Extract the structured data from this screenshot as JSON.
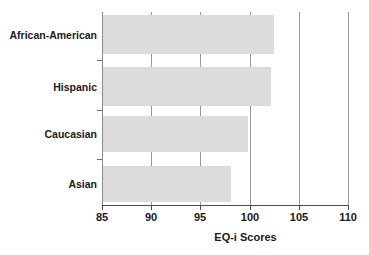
{
  "chart_data": {
    "type": "bar",
    "orientation": "horizontal",
    "title": "",
    "subtitle": "",
    "categories": [
      "African-American",
      "Hispanic",
      "Caucasian",
      "Asian"
    ],
    "values": [
      102.5,
      102.2,
      99.8,
      98.1
    ],
    "xlabel": "EQ-i Scores",
    "ylabel": "",
    "xlim": [
      85,
      110
    ],
    "xticks": [
      85,
      90,
      95,
      100,
      105,
      110
    ],
    "xtick_labels": [
      "85",
      "90",
      "95",
      "100",
      "105",
      "110"
    ],
    "grid": true,
    "legend": "none",
    "bar_color": "#dcdcdc",
    "axis_color": "#4d4d4d",
    "gridline_color": "#9a9a9a",
    "text_color": "#1a1a1a",
    "background": "#ffffff"
  },
  "axis": {
    "x_title": "EQ-i Scores"
  },
  "ticks": {
    "t0": "85",
    "t1": "90",
    "t2": "95",
    "t3": "100",
    "t4": "105",
    "t5": "110"
  },
  "categories": {
    "c0": "African-American",
    "c1": "Hispanic",
    "c2": "Caucasian",
    "c3": "Asian"
  }
}
